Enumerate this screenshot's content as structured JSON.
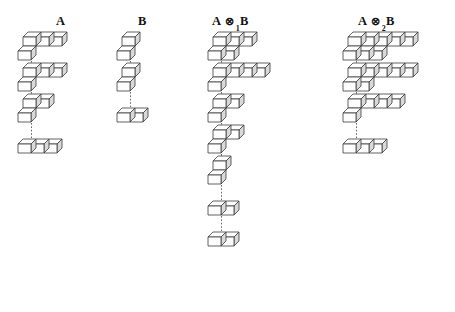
{
  "figure": {
    "background_color": "#ffffff",
    "cube": {
      "width": 13,
      "height": 9,
      "depth_x": 5,
      "depth_y": 5,
      "top_face_color": "#ffffff",
      "front_face_color": "#fdfdfd",
      "side_face_color": "#d9d9d9",
      "edge_color": "#3a3a3a"
    },
    "connector": {
      "style": "dotted-vertical",
      "color": "#555555"
    }
  },
  "columns": [
    {
      "id": "col-a",
      "label_text": "A",
      "label_parts": {
        "left": "A",
        "operator": "",
        "subscript": "",
        "right": ""
      },
      "header_x": 56,
      "header_y": 14,
      "origin_x": 18,
      "origin_y": 60,
      "row_gap": 31,
      "rows": [
        {
          "index": 0,
          "cubes_back": 3,
          "cubes_front": 1,
          "total": 4
        },
        {
          "index": 1,
          "cubes_back": 3,
          "cubes_front": 1,
          "total": 4
        },
        {
          "index": 2,
          "cubes_back": 2,
          "cubes_front": 1,
          "total": 3
        },
        {
          "index": 3,
          "cubes_back": 0,
          "cubes_front": 3,
          "total": 3
        }
      ]
    },
    {
      "id": "col-b",
      "label_text": "B",
      "label_parts": {
        "left": "B",
        "operator": "",
        "subscript": "",
        "right": ""
      },
      "header_x": 138,
      "header_y": 14,
      "origin_x": 117,
      "origin_y": 60,
      "row_gap": 31,
      "rows": [
        {
          "index": 0,
          "cubes_back": 1,
          "cubes_front": 1,
          "total": 2
        },
        {
          "index": 1,
          "cubes_back": 1,
          "cubes_front": 1,
          "total": 2
        },
        {
          "index": 2,
          "cubes_back": 0,
          "cubes_front": 2,
          "total": 2
        }
      ]
    },
    {
      "id": "col-a-tensor1-b",
      "label_text": "A ⊗1B",
      "label_parts": {
        "left": "A",
        "operator": "⊗",
        "subscript": "1",
        "right": "B"
      },
      "header_x": 212,
      "header_y": 14,
      "origin_x": 208,
      "origin_y": 60,
      "row_gap": 31,
      "rows": [
        {
          "index": 0,
          "cubes_back": 3,
          "cubes_front": 2,
          "total": 5
        },
        {
          "index": 1,
          "cubes_back": 4,
          "cubes_front": 1,
          "total": 5
        },
        {
          "index": 2,
          "cubes_back": 2,
          "cubes_front": 1,
          "total": 3
        },
        {
          "index": 3,
          "cubes_back": 2,
          "cubes_front": 1,
          "total": 3
        },
        {
          "index": 4,
          "cubes_back": 1,
          "cubes_front": 1,
          "total": 2
        },
        {
          "index": 5,
          "cubes_back": 0,
          "cubes_front": 2,
          "total": 2
        },
        {
          "index": 6,
          "cubes_back": 0,
          "cubes_front": 2,
          "total": 2
        }
      ]
    },
    {
      "id": "col-a-tensor2-b",
      "label_text": "A ⊗2B",
      "label_parts": {
        "left": "A",
        "operator": "⊗",
        "subscript": "2",
        "right": "B"
      },
      "header_x": 358,
      "header_y": 14,
      "origin_x": 343,
      "origin_y": 60,
      "row_gap": 31,
      "rows": [
        {
          "index": 0,
          "cubes_back": 5,
          "cubes_front": 3,
          "total": 8
        },
        {
          "index": 1,
          "cubes_back": 5,
          "cubes_front": 2,
          "total": 7
        },
        {
          "index": 2,
          "cubes_back": 4,
          "cubes_front": 1,
          "total": 5
        },
        {
          "index": 3,
          "cubes_back": 0,
          "cubes_front": 3,
          "total": 3
        }
      ]
    }
  ]
}
